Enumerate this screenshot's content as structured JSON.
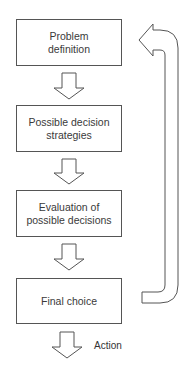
{
  "diagram": {
    "steps": [
      {
        "line1": "Problem",
        "line2": "definition"
      },
      {
        "line1": "Possible decision",
        "line2": "strategies"
      },
      {
        "line1": "Evaluation of",
        "line2": "possible decisions"
      },
      {
        "line1": "Final choice",
        "line2": ""
      }
    ],
    "output_label": "Action",
    "feedback_arrow": "loop back from Final choice to Problem definition",
    "colors": {
      "stroke": "#555555",
      "text": "#3a3a3a",
      "background": "#ffffff"
    }
  }
}
